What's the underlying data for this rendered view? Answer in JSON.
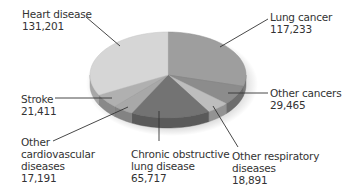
{
  "chart_data": {
    "type": "pie",
    "style": "3d",
    "title": "",
    "categories": [
      "Lung cancer",
      "Other cancers",
      "Other respiratory diseases",
      "Chronic obstructive lung disease",
      "Other cardiovascular diseases",
      "Stroke",
      "Heart disease"
    ],
    "values": [
      117233,
      29465,
      18891,
      65717,
      17191,
      21411,
      131201
    ],
    "colors": [
      "#9e9e9e",
      "#8c8c8c",
      "#bdbdbd",
      "#737373",
      "#a8a8a8",
      "#b0b0b0",
      "#d6d6d6"
    ],
    "start_angle_deg": 0,
    "direction": "clockwise",
    "legend": "none (leader-line labels)"
  },
  "labels": {
    "heart": {
      "line1": "Heart disease",
      "value": "131,201"
    },
    "lung": {
      "line1": "Lung cancer",
      "value": "117,233"
    },
    "othercan": {
      "line1": "Other cancers",
      "value": "29,465"
    },
    "stroke": {
      "line1": "Stroke",
      "value": "21,411"
    },
    "othercardio": {
      "line1": "Other",
      "line2": "cardiovascular",
      "line3": "diseases",
      "value": "17,191"
    },
    "copd": {
      "line1": "Chronic obstructive",
      "line2": "lung disease",
      "value": "65,717"
    },
    "otherresp": {
      "line1": "Other respiratory",
      "line2": "diseases",
      "value": "18,891"
    }
  }
}
